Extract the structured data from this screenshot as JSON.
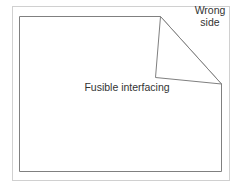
{
  "diagram": {
    "labels": {
      "fusible_interfacing": "Fusible interfacing",
      "wrong_side_line1": "Wrong",
      "wrong_side_line2": "side"
    },
    "colors": {
      "outer_border": "#d0d0d0",
      "fabric_outline": "#808080",
      "text": "#333333",
      "background": "#ffffff"
    }
  }
}
